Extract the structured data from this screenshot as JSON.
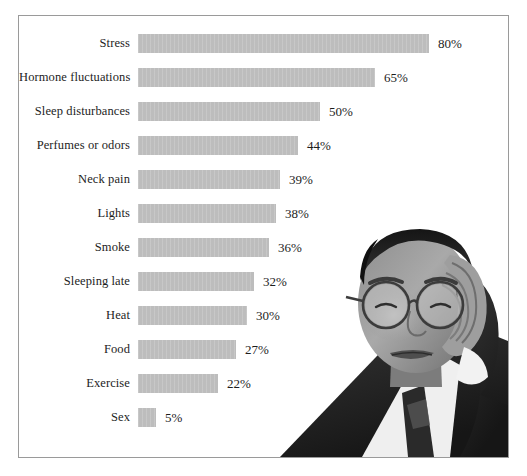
{
  "chart_data": {
    "type": "bar",
    "orientation": "horizontal",
    "title": "",
    "xlabel": "",
    "ylabel": "",
    "xlim": [
      0,
      80
    ],
    "grid": false,
    "legend": false,
    "value_suffix": "%",
    "categories": [
      "Stress",
      "Hormone fluctuations",
      "Sleep disturbances",
      "Perfumes or odors",
      "Neck pain",
      "Lights",
      "Smoke",
      "Sleeping late",
      "Heat",
      "Food",
      "Exercise",
      "Sex"
    ],
    "values": [
      80,
      65,
      50,
      44,
      39,
      38,
      36,
      32,
      30,
      27,
      22,
      5
    ],
    "value_labels": [
      "80%",
      "65%",
      "50%",
      "44%",
      "39%",
      "38%",
      "36%",
      "32%",
      "30%",
      "27%",
      "22%",
      "5%"
    ]
  },
  "rows": [
    {
      "label": "Stress",
      "value": 80,
      "value_label": "80%"
    },
    {
      "label": "Hormone fluctuations",
      "value": 65,
      "value_label": "65%"
    },
    {
      "label": "Sleep disturbances",
      "value": 50,
      "value_label": "50%"
    },
    {
      "label": "Perfumes or odors",
      "value": 44,
      "value_label": "44%"
    },
    {
      "label": "Neck pain",
      "value": 39,
      "value_label": "39%"
    },
    {
      "label": "Lights",
      "value": 38,
      "value_label": "38%"
    },
    {
      "label": "Smoke",
      "value": 36,
      "value_label": "36%"
    },
    {
      "label": "Sleeping late",
      "value": 32,
      "value_label": "32%"
    },
    {
      "label": "Heat",
      "value": 30,
      "value_label": "30%"
    },
    {
      "label": "Food",
      "value": 27,
      "value_label": "27%"
    },
    {
      "label": "Exercise",
      "value": 22,
      "value_label": "22%"
    },
    {
      "label": "Sex",
      "value": 5,
      "value_label": "5%"
    }
  ],
  "photo": {
    "name": "man-with-headache-photo",
    "description": "Grayscale photograph of a man wearing glasses holding his head"
  },
  "colors": {
    "bar_fill": "#bdbdbd",
    "frame_border": "#9a9a9a",
    "text": "#1d1d1d",
    "background": "#ffffff"
  },
  "layout": {
    "bar_origin_x": 119,
    "px_per_percent": 3.64,
    "row_pitch": 34,
    "first_row_top": 18
  }
}
